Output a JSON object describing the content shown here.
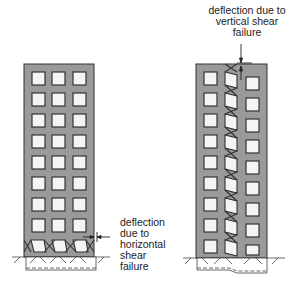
{
  "diagram": {
    "left_panel": {
      "title": "horizontal shear failure building",
      "annotation": [
        "deflection",
        "due to",
        "horizontal",
        "shear",
        "failure"
      ],
      "window_rows": 8,
      "window_columns": 3
    },
    "right_panel": {
      "title": "vertical shear failure building",
      "annotation": [
        "deflection due to",
        "vertical shear",
        "failure"
      ],
      "window_rows": 9,
      "window_columns": 3
    },
    "colors": {
      "building_fill": "#9a9a9a",
      "window_fill": "#f4f4f4",
      "outline": "#333333",
      "text": "#222222"
    }
  }
}
